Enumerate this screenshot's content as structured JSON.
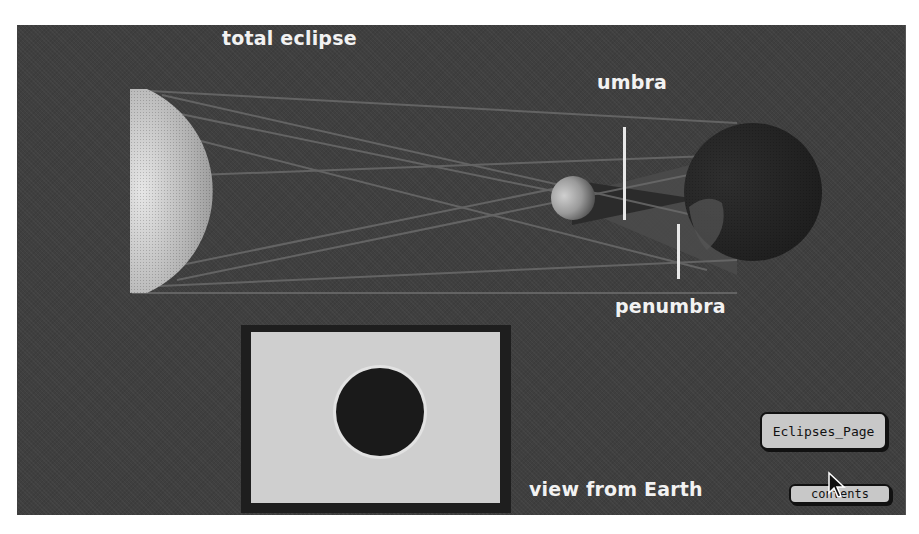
{
  "diagram": {
    "title": "total eclipse",
    "labels": {
      "umbra": "umbra",
      "penumbra": "penumbra",
      "view_caption": "view from Earth"
    },
    "bodies": [
      "sun",
      "moon",
      "earth"
    ]
  },
  "buttons": {
    "eclipses_page": "Eclipses_Page",
    "contents": "contents"
  },
  "colors": {
    "background": "#3f3f3f",
    "label_text": "#f2f2f2",
    "button_face": "#c8c8c8",
    "inset_sky": "#cfcfcf"
  }
}
